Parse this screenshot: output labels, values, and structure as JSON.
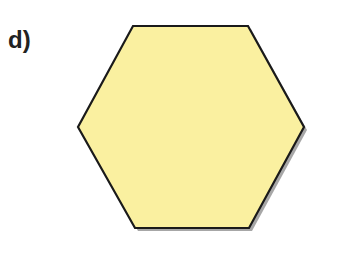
{
  "figure": {
    "label": "d)",
    "shape": {
      "type": "hexagon",
      "points": "133,26 248,26 304,127 249,228 135,228 78,127",
      "shadow_points": "136,29 251,29 307,130 252,231 138,231 81,130",
      "fill": "#FAF0A0",
      "stroke": "#1a1a1a",
      "shadow": "#8a8a8a"
    }
  }
}
